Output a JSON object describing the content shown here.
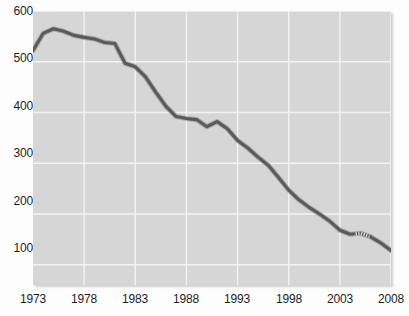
{
  "chart_data": {
    "type": "line",
    "title": "",
    "subtitle": "",
    "xlabel": "",
    "ylabel": "",
    "xlim": [
      1973,
      2008
    ],
    "ylim": [
      60,
      600
    ],
    "grid": true,
    "legend": "none",
    "line_color": "#5a5a5a",
    "plot_background": "#d6d6d6",
    "gridline_color": "#f2f2f2",
    "x_tick_labels": [
      "1973",
      "1978",
      "1983",
      "1988",
      "1993",
      "1998",
      "2003",
      "2008"
    ],
    "x_ticks": [
      1973,
      1978,
      1983,
      1988,
      1993,
      1998,
      2003,
      2008
    ],
    "y_tick_labels": [
      "600",
      "500",
      "400",
      "300",
      "200",
      "100"
    ],
    "y_ticks": [
      600,
      500,
      400,
      300,
      200,
      100
    ],
    "series": [
      {
        "name": "value",
        "style": "solid-with-dashed-segment",
        "dashed_segment_x": [
          2004.4,
          2005.9
        ],
        "x": [
          1973,
          1974,
          1975,
          1976,
          1977,
          1978,
          1979,
          1980,
          1981,
          1982,
          1983,
          1984,
          1985,
          1986,
          1987,
          1988,
          1989,
          1990,
          1991,
          1992,
          1993,
          1994,
          1995,
          1996,
          1997,
          1998,
          1999,
          2000,
          2001,
          2002,
          2003,
          2004,
          2005,
          2006,
          2007,
          2008
        ],
        "values": [
          522,
          556,
          565,
          560,
          552,
          548,
          545,
          538,
          536,
          497,
          490,
          470,
          440,
          412,
          392,
          388,
          386,
          372,
          382,
          368,
          345,
          330,
          312,
          296,
          272,
          247,
          228,
          213,
          200,
          186,
          168,
          160,
          162,
          155,
          143,
          128
        ]
      }
    ]
  }
}
